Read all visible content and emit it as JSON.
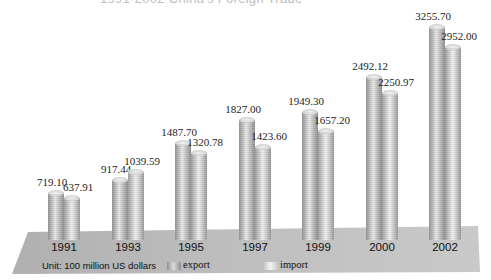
{
  "chart_data": {
    "type": "bar",
    "title": "1991-2002 China's Foreign Trade",
    "categories": [
      "1991",
      "1993",
      "1995",
      "1997",
      "1999",
      "2000",
      "2002"
    ],
    "series": [
      {
        "name": "export",
        "values": [
          719.1,
          917.44,
          1487.7,
          1827.0,
          1949.3,
          2492.12,
          3255.7
        ],
        "labels": [
          "719.10",
          "917.44",
          "1487.70",
          "1827.00",
          "1949.30",
          "2492.12",
          "3255.70"
        ]
      },
      {
        "name": "import",
        "values": [
          637.91,
          1039.59,
          1320.78,
          1423.6,
          1657.2,
          2250.97,
          2952.0
        ],
        "labels": [
          "637.91",
          "1039.59",
          "1320.78",
          "1423.60",
          "1657.20",
          "2250.97",
          "2952.00"
        ]
      }
    ],
    "unit_note": "Unit: 100 million US dollars",
    "xlabel": "",
    "ylabel": "",
    "grid": false,
    "legend_position": "bottom",
    "style": "3d-cylinder"
  },
  "legend": {
    "unit": "Unit: 100 million US dollars",
    "export": "export",
    "import": "import"
  },
  "colors": {
    "floor": "#b8b8b8",
    "bar": "#bdbdbd",
    "background": "#ffffff"
  }
}
